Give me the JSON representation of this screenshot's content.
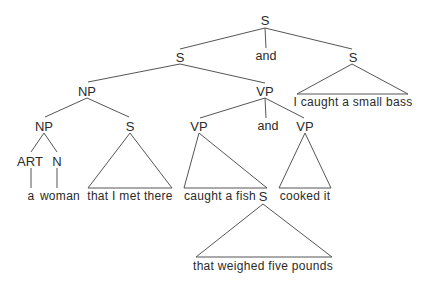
{
  "diagram": {
    "type": "syntax-tree",
    "nodes": {
      "root": {
        "label": "S",
        "x": 265,
        "y": 20
      },
      "conj_top": {
        "label": "and",
        "x": 266,
        "y": 56
      },
      "s_left": {
        "label": "S",
        "x": 180,
        "y": 57
      },
      "s_right": {
        "label": "S",
        "x": 353,
        "y": 57
      },
      "np": {
        "label": "NP",
        "x": 87,
        "y": 91
      },
      "vp": {
        "label": "VP",
        "x": 265,
        "y": 91
      },
      "np_inner": {
        "label": "NP",
        "x": 44,
        "y": 126
      },
      "s_rel": {
        "label": "S",
        "x": 130,
        "y": 126
      },
      "vp_left": {
        "label": "VP",
        "x": 199,
        "y": 126
      },
      "conj_vp": {
        "label": "and",
        "x": 268,
        "y": 126
      },
      "vp_right": {
        "label": "VP",
        "x": 305,
        "y": 126
      },
      "art": {
        "label": "ART",
        "x": 30,
        "y": 161
      },
      "n": {
        "label": "N",
        "x": 57,
        "y": 161
      },
      "s_fish": {
        "label": "S",
        "x": 263,
        "y": 196
      }
    },
    "leaves": {
      "a": {
        "text": "a",
        "x": 31,
        "y": 196
      },
      "woman": {
        "text": "woman",
        "x": 60,
        "y": 196
      },
      "rel_clause": {
        "text": "that I met there",
        "x": 130,
        "y": 196
      },
      "caught_fish": {
        "text": "caught a fish",
        "x": 220,
        "y": 196
      },
      "cooked_it": {
        "text": "cooked it",
        "x": 305,
        "y": 196
      },
      "small_bass": {
        "text": "I caught a small bass",
        "x": 353,
        "y": 102
      },
      "weighed": {
        "text": "that weighed five pounds",
        "x": 263,
        "y": 266
      }
    },
    "colors": {
      "line": "#555555",
      "text": "#2a2a2a",
      "background": "#ffffff"
    }
  }
}
